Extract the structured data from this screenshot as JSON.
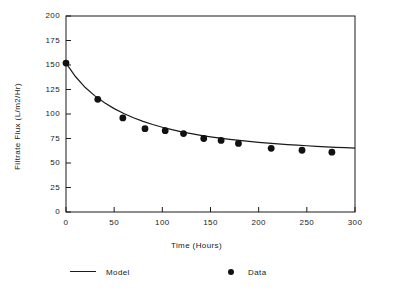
{
  "chart_data": {
    "type": "scatter",
    "title": "",
    "xlabel": "Time (Hours)",
    "ylabel": "Filtrate Flux  (L/m2/Hr)",
    "xlim": [
      0,
      300
    ],
    "ylim": [
      0,
      200
    ],
    "xticks": [
      0,
      50,
      100,
      150,
      200,
      250,
      300
    ],
    "yticks": [
      0,
      25,
      50,
      75,
      100,
      125,
      150,
      175,
      200
    ],
    "grid": false,
    "legend_position": "below-axes",
    "series": [
      {
        "name": "Model",
        "style": "line",
        "color": "#1a1a1a",
        "x": [
          0,
          10,
          20,
          30,
          40,
          50,
          60,
          70,
          80,
          90,
          100,
          110,
          120,
          130,
          140,
          150,
          160,
          170,
          180,
          190,
          200,
          210,
          220,
          230,
          240,
          250,
          260,
          270,
          280,
          290,
          300
        ],
        "values": [
          152.0,
          138.0,
          127.0,
          118.5,
          111.5,
          105.5,
          100.5,
          96.2,
          92.5,
          89.3,
          86.5,
          84.0,
          81.8,
          79.9,
          78.2,
          76.7,
          75.3,
          74.1,
          73.0,
          72.0,
          71.1,
          70.3,
          69.5,
          68.8,
          68.2,
          67.6,
          67.0,
          66.5,
          66.0,
          65.6,
          65.2
        ]
      },
      {
        "name": "Data",
        "style": "markers",
        "color": "#111111",
        "x": [
          0,
          33,
          59,
          82,
          103,
          122,
          143,
          161,
          179,
          213,
          245,
          276
        ],
        "values": [
          152,
          115,
          96,
          85,
          83,
          80,
          75,
          73,
          70,
          65,
          63,
          61
        ]
      }
    ]
  },
  "legend": {
    "model_label": "Model",
    "data_label": "Data"
  },
  "axes": {
    "x_title": "Time (Hours)",
    "y_title": "Filtrate Flux  (L/m2/Hr)",
    "x_tick_labels": [
      "0",
      "50",
      "100",
      "150",
      "200",
      "250",
      "300"
    ],
    "y_tick_labels": [
      "0",
      "25",
      "50",
      "75",
      "100",
      "125",
      "150",
      "175",
      "200"
    ]
  },
  "colors": {
    "ink": "#1a1a1a",
    "marker": "#111111",
    "background": "#ffffff"
  }
}
